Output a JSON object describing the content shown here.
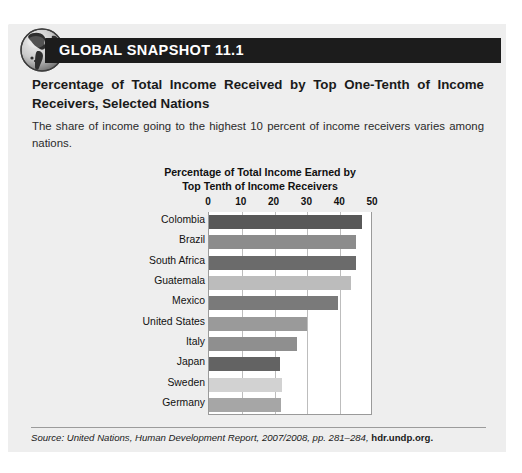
{
  "header": {
    "band_label": "GLOBAL SNAPSHOT 11.1",
    "globe_icon": "globe-icon",
    "band_color": "#1c1c1c",
    "band_text_color": "#ffffff"
  },
  "panel": {
    "background_color": "#eeeeee",
    "headline": "Percentage of Total Income Received by Top One-Tenth of Income Receivers, Selected Nations",
    "subtext": "The share of income going to the highest 10 percent of income receivers varies among nations."
  },
  "footer": {
    "source_prefix": "Source: United Nations, Human Development Report, 2007/2008, pp. 281–284, ",
    "source_url": "hdr.undp.org."
  },
  "chart_data": {
    "type": "bar",
    "orientation": "horizontal",
    "title": "Percentage of Total Income Earned by Top Tenth of Income Receivers",
    "title_line1": "Percentage of Total Income Earned by",
    "title_line2": "Top Tenth of Income Receivers",
    "xlabel": "",
    "ylabel": "",
    "xlim": [
      0,
      50
    ],
    "xticks": [
      0,
      10,
      20,
      30,
      40,
      50
    ],
    "xtick_labels": [
      "0",
      "10",
      "20",
      "30",
      "40",
      "50"
    ],
    "grid": true,
    "legend": false,
    "categories": [
      "Colombia",
      "Brazil",
      "South Africa",
      "Guatemala",
      "Mexico",
      "United States",
      "Italy",
      "Japan",
      "Sweden",
      "Germany"
    ],
    "values": [
      46.5,
      44.8,
      44.7,
      43.4,
      39.4,
      29.9,
      26.8,
      21.7,
      22.2,
      22.1
    ],
    "bar_colors": [
      "#585858",
      "#8c8c8c",
      "#6b6b6b",
      "#bcbcbc",
      "#7a7a7a",
      "#9a9a9a",
      "#8f8f8f",
      "#636363",
      "#d2d2d2",
      "#a6a6a6"
    ]
  }
}
